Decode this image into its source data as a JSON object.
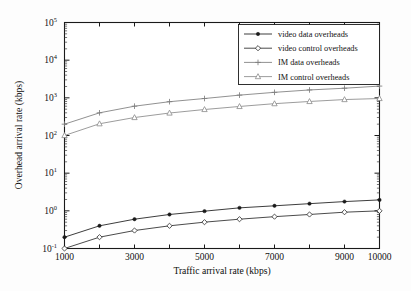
{
  "chart_data": {
    "type": "line",
    "title": "",
    "xlabel": "Traffic arrival rate (kbps)",
    "ylabel": "Overhead arrival rate (kbps)",
    "xscale": "linear",
    "yscale": "log",
    "xlim": [
      1000,
      10000
    ],
    "ylim": [
      0.1,
      100000
    ],
    "grid": false,
    "legend_position": "upper right",
    "x_ticks": [
      1000,
      2000,
      3000,
      4000,
      5000,
      6000,
      7000,
      8000,
      9000,
      10000
    ],
    "x_tick_labels": [
      "1000",
      "",
      "3000",
      "",
      "5000",
      "",
      "7000",
      "",
      "9000",
      "10000"
    ],
    "y_ticks": [
      0.1,
      1,
      10,
      100,
      1000,
      10000,
      100000
    ],
    "y_tick_labels": [
      "10",
      "10",
      "10",
      "10",
      "10",
      "10",
      "10"
    ],
    "y_tick_exponents": [
      "-1",
      "0",
      "1",
      "2",
      "3",
      "4",
      "5"
    ],
    "x": [
      1000,
      2000,
      3000,
      4000,
      5000,
      6000,
      7000,
      8000,
      9000,
      10000
    ],
    "series": [
      {
        "name": "video data overheads",
        "marker": "filled-circle",
        "color": "#1a1a1a",
        "values": [
          0.2,
          0.4,
          0.6,
          0.8,
          0.98,
          1.2,
          1.36,
          1.55,
          1.76,
          1.95
        ]
      },
      {
        "name": "video control overheads",
        "marker": "open-diamond",
        "color": "#2b2b2b",
        "values": [
          0.1,
          0.2,
          0.3,
          0.4,
          0.5,
          0.6,
          0.7,
          0.8,
          0.92,
          1.0
        ]
      },
      {
        "name": "IM    data overheads",
        "marker": "plus",
        "color": "#7d7d7d",
        "values": [
          200,
          400,
          600,
          790,
          960,
          1180,
          1400,
          1620,
          1800,
          2050
        ]
      },
      {
        "name": "IM    control overheads",
        "marker": "open-triangle",
        "color": "#8a8a8a",
        "values": [
          100,
          205,
          300,
          395,
          490,
          590,
          700,
          800,
          900,
          960
        ]
      }
    ]
  },
  "legend": {
    "items": [
      {
        "label": "video data overheads"
      },
      {
        "label": "video control overheads"
      },
      {
        "label": "IM    data overheads"
      },
      {
        "label": "IM    control overheads"
      }
    ]
  },
  "axes": {
    "x_title": "Traffic arrival rate (kbps)",
    "y_title": "Overhead arrival rate (kbps)"
  }
}
